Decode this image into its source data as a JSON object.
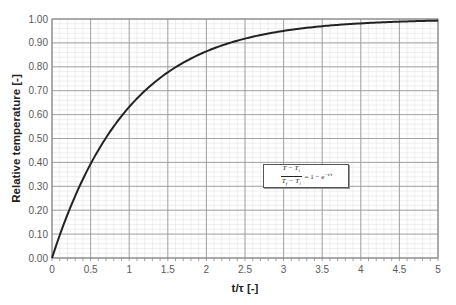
{
  "chart_data": {
    "type": "line",
    "title": "",
    "xlabel": "t/τ [-]",
    "ylabel": "Relative temperature [-]",
    "xlim": [
      0,
      5
    ],
    "ylim": [
      0,
      1
    ],
    "x_ticks": [
      "0",
      "0.5",
      "1",
      "1.5",
      "2",
      "2.5",
      "3",
      "3.5",
      "4",
      "4.5",
      "5"
    ],
    "y_ticks": [
      "0.00",
      "0.10",
      "0.20",
      "0.30",
      "0.40",
      "0.50",
      "0.60",
      "0.70",
      "0.80",
      "0.90",
      "1.00"
    ],
    "grid": {
      "major": true,
      "minor": true
    },
    "legend": "none",
    "series": [
      {
        "name": "1 - e^(-t/τ)",
        "color": "#222222",
        "x": [
          0,
          0.25,
          0.5,
          0.75,
          1,
          1.25,
          1.5,
          1.75,
          2,
          2.25,
          2.5,
          2.75,
          3,
          3.25,
          3.5,
          3.75,
          4,
          4.25,
          4.5,
          4.75,
          5
        ],
        "y": [
          0,
          0.22,
          0.39,
          0.53,
          0.63,
          0.71,
          0.78,
          0.83,
          0.86,
          0.89,
          0.92,
          0.94,
          0.95,
          0.96,
          0.97,
          0.98,
          0.98,
          0.99,
          0.99,
          0.99,
          0.99
        ]
      }
    ],
    "annotations": [
      {
        "text": "(T - T_i)/(T_f - T_i) = 1 - e^(-t/τ)",
        "x": 3.4,
        "y": 0.38
      }
    ]
  },
  "equation": {
    "numerator": "T − T",
    "num_sub": "i",
    "denominator": "T",
    "den_sub1": "f",
    "den_mid": " − T",
    "den_sub2": "i",
    "rhs": "= 1 − e",
    "exp": "−t/τ"
  }
}
